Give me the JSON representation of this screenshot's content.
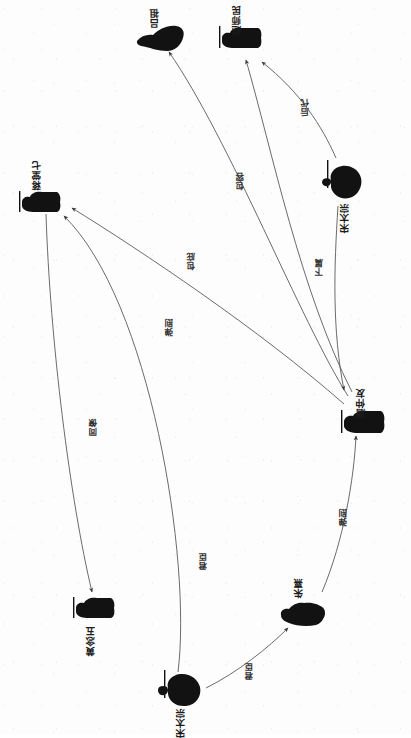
{
  "meta": {
    "orientation": "rotated-90-ccw",
    "ink_color": "#1b1b1b",
    "edge_color": "#555555",
    "background": "#fdfdfd"
  },
  "graph": {
    "type": "directed-social-network",
    "node_icon": "person-silhouette-icon",
    "nodes": [
      {
        "id": "n1",
        "label": "吕祖",
        "x": 158,
        "y": 30,
        "icon": "person-silhouette-icon"
      },
      {
        "id": "n2",
        "label": "赵师民",
        "x": 240,
        "y": 32,
        "icon": "person-silhouette-icon"
      },
      {
        "id": "n3",
        "label": "宋太宗",
        "x": 344,
        "y": 178,
        "icon": "person-silhouette-icon"
      },
      {
        "id": "n4",
        "label": "蒋堂七",
        "x": 42,
        "y": 190,
        "icon": "person-silhouette-icon"
      },
      {
        "id": "n5",
        "label": "唐仲友",
        "x": 360,
        "y": 413,
        "icon": "person-silhouette-icon"
      },
      {
        "id": "n6",
        "label": "黄念五",
        "x": 92,
        "y": 610,
        "icon": "person-silhouette-icon"
      },
      {
        "id": "n7",
        "label": "朱熹",
        "x": 297,
        "y": 611,
        "icon": "person-silhouette-icon"
      },
      {
        "id": "n8",
        "label": "宋太宗",
        "x": 178,
        "y": 690,
        "icon": "person-silhouette-icon"
      }
    ],
    "edges": [
      {
        "from": "n3",
        "to": "n2",
        "label": "后代",
        "lx": 302,
        "ly": 98
      },
      {
        "from": "n5",
        "to": "n2",
        "label": "包容",
        "lx": 237,
        "ly": 172
      },
      {
        "from": "n5",
        "to": "n1",
        "label": "包庇",
        "lx": 188,
        "ly": 252
      },
      {
        "from": "n5",
        "to": "n4",
        "label": "弹刡",
        "lx": 166,
        "ly": 318
      },
      {
        "from": "n3",
        "to": "n5",
        "label": "下属",
        "lx": 316,
        "ly": 258
      },
      {
        "from": "n4",
        "to": "n6",
        "label": "同僚",
        "lx": 90,
        "ly": 418
      },
      {
        "from": "n7",
        "to": "n5",
        "label": "弹刡",
        "lx": 340,
        "ly": 508
      },
      {
        "from": "n8",
        "to": "n4",
        "label": "君臣",
        "lx": 200,
        "ly": 552
      },
      {
        "from": "n8",
        "to": "n7",
        "label": "君臣",
        "lx": 246,
        "ly": 662
      }
    ]
  }
}
